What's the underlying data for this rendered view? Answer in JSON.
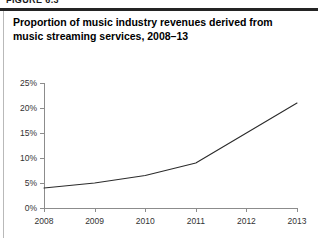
{
  "figure": {
    "label": "FIGURE 6.3",
    "title": "Proportion of music industry revenues derived from music streaming services, 2008–13"
  },
  "colors": {
    "rule": "#242424",
    "border": "#b9b9b9",
    "axis": "#8c8c8c",
    "line": "#2b2b2b",
    "text": "#333333"
  },
  "chart_data": {
    "type": "line",
    "title": "Proportion of music industry revenues derived from music streaming services, 2008–13",
    "xlabel": "",
    "ylabel": "",
    "categories": [
      "2008",
      "2009",
      "2010",
      "2011",
      "2012",
      "2013"
    ],
    "x": [
      2008,
      2009,
      2010,
      2011,
      2012,
      2013
    ],
    "values": [
      4,
      5,
      6.5,
      9,
      15,
      21
    ],
    "series": [
      {
        "name": "Streaming share of music industry revenues",
        "values": [
          4,
          5,
          6.5,
          9,
          15,
          21
        ]
      }
    ],
    "ylim": [
      0,
      25
    ],
    "ytick_values": [
      0,
      5,
      10,
      15,
      20,
      25
    ],
    "ytick_labels": [
      "0%",
      "5%",
      "10%",
      "15%",
      "20%",
      "25%"
    ],
    "xtick_labels": [
      "2008",
      "2009",
      "2010",
      "2011",
      "2012",
      "2013"
    ],
    "grid": false,
    "legend": false,
    "legend_position": "none",
    "markers": false
  }
}
